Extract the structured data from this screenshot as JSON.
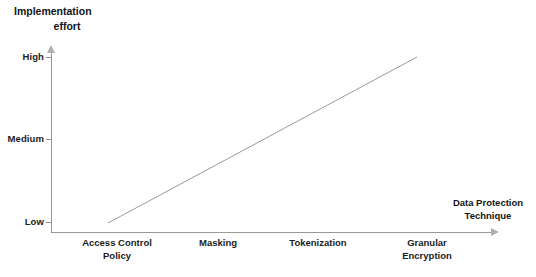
{
  "chart_data": {
    "type": "line",
    "title": "Implementation effort",
    "title_lines": [
      "Implementation",
      "effort"
    ],
    "xlabel": "Data Protection Technique",
    "xlabel_lines": [
      "Data Protection",
      "Technique"
    ],
    "ylabel": "Implementation effort",
    "categories": [
      "Access Control Policy",
      "Masking",
      "Tokenization",
      "Granular Encryption"
    ],
    "category_lines": [
      [
        "Access Control",
        "Policy"
      ],
      [
        "Masking"
      ],
      [
        "Tokenization"
      ],
      [
        "Granular",
        "Encryption"
      ]
    ],
    "y_tick_labels": [
      "High",
      "Medium",
      "Low"
    ],
    "yticks": [
      "Low",
      "Medium",
      "High"
    ],
    "values": [
      "Low",
      "Medium-Low",
      "Medium-High",
      "High"
    ],
    "series": [
      {
        "name": "Implementation effort",
        "values": [
          0,
          1,
          2,
          3
        ],
        "points": [
          {
            "x": "Access Control Policy",
            "y": "Low"
          },
          {
            "x": "Granular Encryption",
            "y": "High"
          }
        ]
      }
    ],
    "line_start": {
      "x": 108,
      "y": 223
    },
    "line_end": {
      "x": 417,
      "y": 57
    },
    "grid": false,
    "legend": false,
    "annotations": [],
    "colors": {
      "line": "#9a9a9a",
      "axis": "#9a9a9a",
      "text": "#141414",
      "background": "#ffffff"
    }
  },
  "axes": {
    "y": {
      "title_lines": [
        "Implementation",
        "effort"
      ],
      "ticks": [
        {
          "label": "High"
        },
        {
          "label": "Medium"
        },
        {
          "label": "Low"
        }
      ]
    },
    "x": {
      "title_lines": [
        "Data Protection",
        "Technique"
      ],
      "ticks": [
        {
          "lines": [
            "Access Control",
            "Policy"
          ]
        },
        {
          "lines": [
            "Masking"
          ]
        },
        {
          "lines": [
            "Tokenization"
          ]
        },
        {
          "lines": [
            "Granular",
            "Encryption"
          ]
        }
      ]
    }
  }
}
